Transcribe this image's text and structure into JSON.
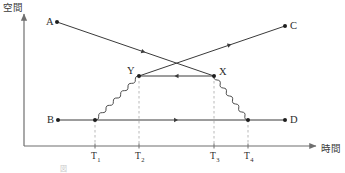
{
  "figure": {
    "title_caption": "図",
    "axes": {
      "y_label": "空間",
      "x_label": "時間",
      "origin_x": 24,
      "origin_y": 146,
      "y_top": 14,
      "x_right": 316
    },
    "tick_labels": [
      {
        "base": "T",
        "sub": "1",
        "x": 95
      },
      {
        "base": "T",
        "sub": "2",
        "x": 139
      },
      {
        "base": "T",
        "sub": "3",
        "x": 214
      },
      {
        "base": "T",
        "sub": "4",
        "x": 248
      }
    ],
    "points": [
      {
        "name": "A",
        "label": "A",
        "x": 57,
        "y": 22,
        "label_dx": -11,
        "label_dy": 3
      },
      {
        "name": "C",
        "label": "C",
        "x": 285,
        "y": 26,
        "label_dx": 5,
        "label_dy": 3
      },
      {
        "name": "Y",
        "label": "Y",
        "x": 139,
        "y": 76,
        "label_dx": -12,
        "label_dy": -2
      },
      {
        "name": "X",
        "label": "X",
        "x": 214,
        "y": 76,
        "label_dx": 5,
        "label_dy": -1
      },
      {
        "name": "B",
        "label": "B",
        "x": 58,
        "y": 120,
        "label_dx": -11,
        "label_dy": 3
      },
      {
        "name": "D",
        "label": "D",
        "x": 285,
        "y": 120,
        "label_dx": 5,
        "label_dy": 3
      },
      {
        "name": "T1-on-B",
        "label": "",
        "x": 95,
        "y": 120,
        "label_dx": 0,
        "label_dy": 0
      },
      {
        "name": "T4-on-B",
        "label": "",
        "x": 248,
        "y": 120,
        "label_dx": 0,
        "label_dy": 0
      }
    ],
    "worldlines": [
      {
        "name": "line-a-to-x",
        "from": "A",
        "to": "X",
        "x1": 57,
        "y1": 22,
        "x2": 214,
        "y2": 76,
        "arrow_t": 0.55,
        "style": "straight"
      },
      {
        "name": "line-y-to-c",
        "from": "Y",
        "to": "C",
        "x1": 139,
        "y1": 76,
        "x2": 285,
        "y2": 26,
        "arrow_t": 0.62,
        "style": "straight"
      },
      {
        "name": "line-x-to-y",
        "from": "X",
        "to": "Y",
        "x1": 214,
        "y1": 76,
        "x2": 139,
        "y2": 76,
        "arrow_t": 0.5,
        "style": "straight"
      },
      {
        "name": "line-b-to-d",
        "from": "B",
        "to": "D",
        "x1": 58,
        "y1": 120,
        "x2": 285,
        "y2": 120,
        "arrow_t": 0.52,
        "style": "straight"
      }
    ],
    "wavy_lines": [
      {
        "name": "photon-t1-to-y",
        "x1": 95,
        "y1": 120,
        "x2": 139,
        "y2": 76
      },
      {
        "name": "photon-x-to-t4",
        "x1": 214,
        "y1": 76,
        "x2": 248,
        "y2": 120
      }
    ],
    "dashed_guides": [
      {
        "name": "guide-t1",
        "x": 95,
        "y_top": 120,
        "y_bottom": 146
      },
      {
        "name": "guide-t2",
        "x": 139,
        "y_top": 76,
        "y_bottom": 146
      },
      {
        "name": "guide-t3",
        "x": 214,
        "y_top": 76,
        "y_bottom": 146
      },
      {
        "name": "guide-t4",
        "x": 248,
        "y_top": 120,
        "y_bottom": 146
      }
    ],
    "colors": {
      "axis": "#6f6f6f",
      "line": "#3a3a3a",
      "dash": "#b9b9b9",
      "dot": "#1e1e1e",
      "text": "#2b2b2b",
      "caption": "#c9c9c9",
      "background": "#ffffff"
    }
  }
}
